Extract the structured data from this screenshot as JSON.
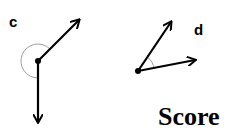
{
  "panels": [
    {
      "label": "c",
      "origin": [
        38,
        61
      ],
      "vectors": [
        [
          80,
          19
        ],
        [
          38,
          123
        ]
      ],
      "angle": "reflex"
    },
    {
      "label": "d",
      "origin": [
        138,
        71
      ],
      "vectors": [
        [
          172,
          21
        ],
        [
          196,
          60
        ]
      ],
      "angle": "acute"
    }
  ],
  "title": "Score",
  "colors": {
    "arrow": "#000000",
    "arc": "#9e9e9e"
  }
}
